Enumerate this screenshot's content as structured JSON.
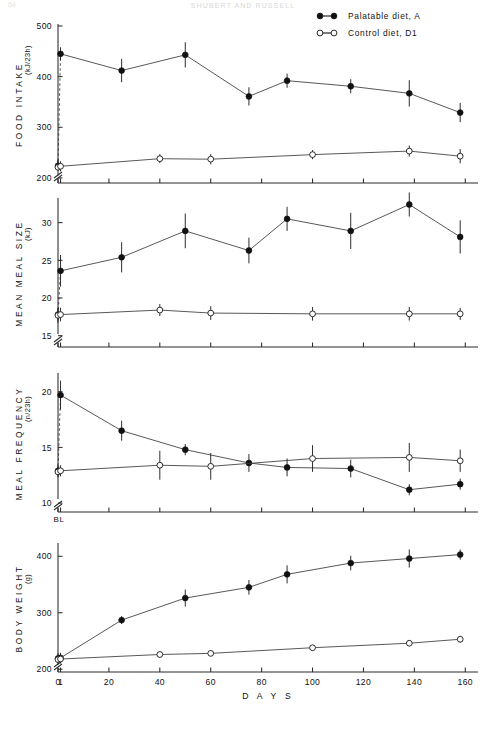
{
  "header": {
    "running_head": "SHUBERT AND RUSSELL",
    "page_number": "64"
  },
  "legend": {
    "position": "top-right",
    "entries": [
      {
        "label": "Palatable diet, A",
        "marker": "filled-circle",
        "color": "#111111"
      },
      {
        "label": "Control diet, D1",
        "marker": "open-circle",
        "color": "#111111"
      }
    ]
  },
  "xaxis": {
    "label": "D A Y S",
    "ticks": [
      0,
      1,
      20,
      40,
      60,
      80,
      100,
      120,
      140,
      160
    ],
    "tick_labels": [
      "0",
      "1",
      "20",
      "40",
      "60",
      "80",
      "100",
      "120",
      "140",
      "160"
    ],
    "range": [
      0,
      165
    ],
    "baseline_label": "BL"
  },
  "chart_data": [
    {
      "type": "line",
      "panel": 1,
      "title": "FOOD INTAKE",
      "ylabel": "FOOD  INTAKE",
      "yunit": "(kJ/23h)",
      "xlabel": "",
      "ylim": [
        190,
        500
      ],
      "yticks": [
        200,
        300,
        400,
        500
      ],
      "ytick_labels": [
        "200",
        "300",
        "400",
        "500"
      ],
      "axis_break_y": true,
      "grid": false,
      "x": [
        0,
        1,
        25,
        50,
        75,
        90,
        115,
        138,
        158
      ],
      "series": [
        {
          "name": "Palatable diet, A",
          "marker": "filled-circle",
          "dashed_first_segment": true,
          "values": [
            224,
            445,
            412,
            443,
            361,
            392,
            381,
            367,
            329
          ],
          "errors": [
            10,
            13,
            23,
            25,
            18,
            14,
            14,
            26,
            19
          ]
        },
        {
          "name": "Control diet, D1",
          "marker": "open-circle",
          "x": [
            0,
            1,
            40,
            60,
            100,
            138,
            158
          ],
          "values": [
            221,
            223,
            238,
            237,
            246,
            253,
            243
          ],
          "errors": [
            16,
            10,
            9,
            10,
            9,
            11,
            14
          ]
        }
      ]
    },
    {
      "type": "line",
      "panel": 2,
      "title": "MEAN MEAL SIZE",
      "ylabel": "MEAN  MEAL  SIZE",
      "yunit": "(kJ)",
      "xlabel": "",
      "ylim": [
        13.5,
        33
      ],
      "yticks": [
        15,
        20,
        25,
        30
      ],
      "ytick_labels": [
        "15",
        "20",
        "25",
        "30"
      ],
      "axis_break_y": true,
      "grid": false,
      "x": [
        0,
        1,
        25,
        50,
        75,
        90,
        115,
        138,
        158
      ],
      "series": [
        {
          "name": "Palatable diet, A",
          "marker": "filled-circle",
          "dashed_first_segment": true,
          "values": [
            17.8,
            23.6,
            25.4,
            28.9,
            26.3,
            30.5,
            28.9,
            32.4,
            28.1
          ],
          "errors": [
            0.8,
            2.1,
            2.0,
            2.3,
            1.7,
            1.6,
            2.4,
            1.6,
            2.2
          ]
        },
        {
          "name": "Control diet, D1",
          "marker": "open-circle",
          "x": [
            0,
            1,
            40,
            60,
            100,
            138,
            158
          ],
          "values": [
            17.7,
            17.8,
            18.4,
            18.0,
            17.9,
            17.9,
            17.9
          ],
          "errors": [
            1.0,
            0.9,
            0.8,
            0.9,
            0.9,
            0.9,
            0.8
          ]
        }
      ]
    },
    {
      "type": "line",
      "panel": 3,
      "title": "MEAL FREQUENCY",
      "ylabel": "MEAL  FREQUENCY",
      "yunit": "(n/23h)",
      "xlabel": "",
      "ylim": [
        9.2,
        21.5
      ],
      "yticks": [
        10,
        15,
        20
      ],
      "ytick_labels": [
        "10",
        "15",
        "20"
      ],
      "axis_break_y": true,
      "grid": false,
      "x": [
        0,
        1,
        25,
        50,
        75,
        90,
        115,
        138,
        158
      ],
      "series": [
        {
          "name": "Palatable diet, A",
          "marker": "filled-circle",
          "dashed_first_segment": true,
          "values": [
            12.9,
            19.7,
            16.5,
            14.8,
            13.6,
            13.2,
            13.1,
            11.2,
            11.7
          ],
          "errors": [
            0.5,
            1.3,
            0.9,
            0.5,
            0.8,
            0.8,
            0.8,
            0.5,
            0.5
          ]
        },
        {
          "name": "Control diet, D1",
          "marker": "open-circle",
          "x": [
            0,
            1,
            40,
            60,
            100,
            138,
            158
          ],
          "values": [
            12.8,
            12.9,
            13.4,
            13.3,
            14.0,
            14.1,
            13.8
          ],
          "errors": [
            0.5,
            0.5,
            1.3,
            1.2,
            1.2,
            1.3,
            1.0
          ]
        }
      ]
    },
    {
      "type": "line",
      "panel": 4,
      "title": "BODY WEIGHT",
      "ylabel": "BODY  WEIGHT",
      "yunit": "(g)",
      "xlabel": "D A Y S",
      "ylim": [
        195,
        420
      ],
      "yticks": [
        200,
        300,
        400
      ],
      "ytick_labels": [
        "200",
        "300",
        "400"
      ],
      "axis_break_y": true,
      "grid": false,
      "x": [
        0,
        1,
        25,
        50,
        75,
        90,
        115,
        138,
        158
      ],
      "series": [
        {
          "name": "Palatable diet, A",
          "marker": "filled-circle",
          "dashed_first_segment": false,
          "values": [
            219,
            220,
            287,
            326,
            345,
            368,
            388,
            396,
            403
          ],
          "errors": [
            9,
            9,
            7,
            15,
            13,
            16,
            13,
            16,
            9
          ]
        },
        {
          "name": "Control diet, D1",
          "marker": "open-circle",
          "x": [
            0,
            1,
            40,
            60,
            100,
            138,
            158
          ],
          "values": [
            217,
            218,
            226,
            228,
            238,
            246,
            253
          ],
          "errors": [
            9,
            8,
            5,
            5,
            5,
            5,
            6
          ]
        }
      ]
    }
  ]
}
